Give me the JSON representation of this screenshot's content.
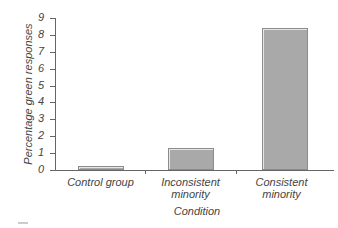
{
  "chart_data": {
    "type": "bar",
    "title": "",
    "xlabel": "Condition",
    "ylabel": "Percentage green responses",
    "categories": [
      "Control group",
      "Inconsistent minority",
      "Consistent minority"
    ],
    "category_lines": [
      [
        "Control group"
      ],
      [
        "Inconsistent",
        "minority"
      ],
      [
        "Consistent",
        "minority"
      ]
    ],
    "values": [
      0.25,
      1.3,
      8.4
    ],
    "ylim": [
      0,
      9
    ],
    "yticks": [
      "0",
      "1",
      "2",
      "3",
      "4",
      "5",
      "6",
      "7",
      "8",
      "9"
    ],
    "grid": false,
    "legend": null,
    "bar_color": "#a9a9a9"
  }
}
